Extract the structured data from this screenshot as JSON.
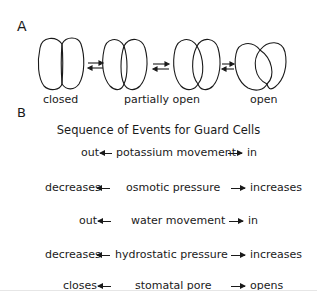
{
  "panel_a": {
    "label": "A",
    "states": [
      "closed",
      "partially open",
      "open"
    ]
  },
  "panel_b": {
    "label": "B",
    "title": "Sequence of Events for Guard Cells",
    "rows": [
      {
        "left": "out",
        "center": "potassium movement",
        "right": "in"
      },
      {
        "left": "decreases",
        "center": "osmotic pressure",
        "right": "increases"
      },
      {
        "left": "out",
        "center": "water movement",
        "right": "in"
      },
      {
        "left": "decreases",
        "center": "hydrostatic pressure",
        "right": "increases"
      },
      {
        "left": "closes",
        "center": "stomatal pore",
        "right": "opens"
      }
    ]
  },
  "colors": {
    "ink": "#1a1a1a",
    "background": "#ffffff"
  }
}
